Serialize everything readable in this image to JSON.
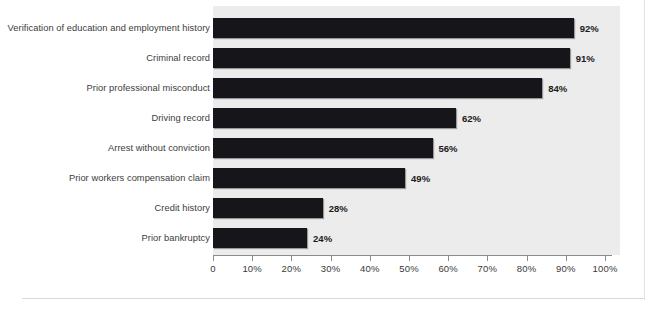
{
  "chart_data": {
    "type": "bar",
    "orientation": "horizontal",
    "title": "",
    "subtitle": "",
    "xlabel": "",
    "ylabel": "",
    "xlim": [
      0,
      100
    ],
    "grid": false,
    "legend": null,
    "value_suffix": "%",
    "categories": [
      "Verification of education and employment history",
      "Criminal record",
      "Prior professional misconduct",
      "Driving record",
      "Arrest without conviction",
      "Prior workers compensation claim",
      "Credit history",
      "Prior bankruptcy"
    ],
    "values": [
      92,
      91,
      84,
      62,
      56,
      49,
      28,
      24
    ],
    "data_labels": [
      "92%",
      "91%",
      "84%",
      "62%",
      "56%",
      "49%",
      "28%",
      "24%"
    ],
    "xticks": [
      0,
      10,
      20,
      30,
      40,
      50,
      60,
      70,
      80,
      90,
      100
    ],
    "xticklabels": [
      "0",
      "10%",
      "20%",
      "30%",
      "40%",
      "50%",
      "60%",
      "70%",
      "80%",
      "90%",
      "100%"
    ],
    "colors": {
      "bar": "#16161a",
      "plot_background": "#ececec",
      "page_background": "#ffffff",
      "axis": "#8b8b8b",
      "label_text": "#3c3c3c",
      "value_text": "#1b1b1b"
    }
  }
}
